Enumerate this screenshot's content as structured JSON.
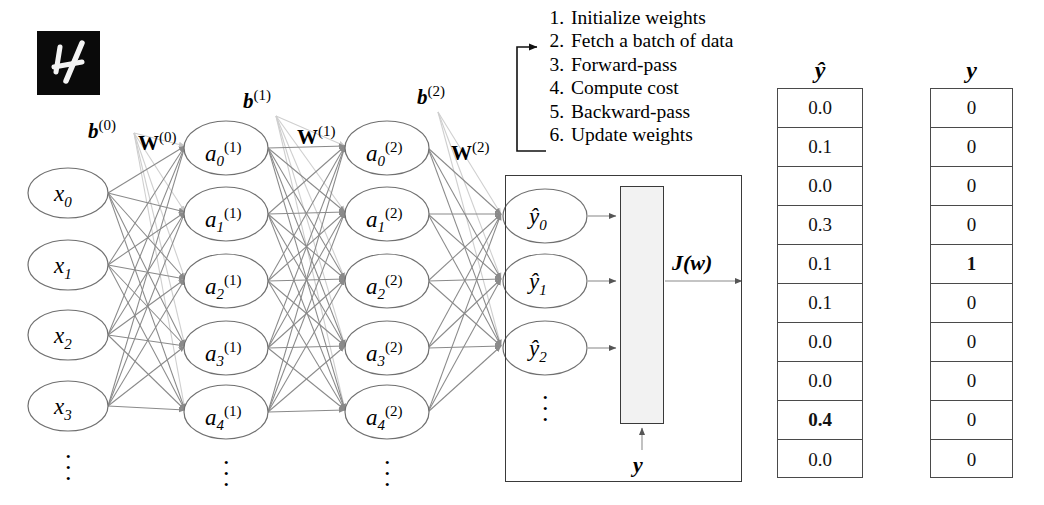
{
  "figure": {
    "type": "neural-network-architecture-diagram",
    "input_image": {
      "alt": "handwritten-digit-4",
      "digit": "4"
    }
  },
  "layers": {
    "input": {
      "name": "input-layer",
      "nodes": [
        {
          "base": "x",
          "sub": "0"
        },
        {
          "base": "x",
          "sub": "1"
        },
        {
          "base": "x",
          "sub": "2"
        },
        {
          "base": "x",
          "sub": "3"
        }
      ],
      "ellipsis": "⋮"
    },
    "hidden1": {
      "name": "hidden-layer-1",
      "superscript": "(1)",
      "nodes": [
        {
          "base": "a",
          "sub": "0",
          "sup": "(1)"
        },
        {
          "base": "a",
          "sub": "1",
          "sup": "(1)"
        },
        {
          "base": "a",
          "sub": "2",
          "sup": "(1)"
        },
        {
          "base": "a",
          "sub": "3",
          "sup": "(1)"
        },
        {
          "base": "a",
          "sub": "4",
          "sup": "(1)"
        }
      ],
      "ellipsis": "⋮"
    },
    "hidden2": {
      "name": "hidden-layer-2",
      "superscript": "(2)",
      "nodes": [
        {
          "base": "a",
          "sub": "0",
          "sup": "(2)"
        },
        {
          "base": "a",
          "sub": "1",
          "sup": "(2)"
        },
        {
          "base": "a",
          "sub": "2",
          "sup": "(2)"
        },
        {
          "base": "a",
          "sub": "3",
          "sup": "(2)"
        },
        {
          "base": "a",
          "sub": "4",
          "sup": "(2)"
        }
      ],
      "ellipsis": "⋮"
    },
    "output": {
      "name": "output-layer",
      "nodes": [
        {
          "base": "ŷ",
          "sub": "0"
        },
        {
          "base": "ŷ",
          "sub": "1"
        },
        {
          "base": "ŷ",
          "sub": "2"
        }
      ],
      "ellipsis": "⋮"
    }
  },
  "parameters": {
    "biases": [
      {
        "base": "b",
        "sup": "(0)"
      },
      {
        "base": "b",
        "sup": "(1)"
      },
      {
        "base": "b",
        "sup": "(2)"
      }
    ],
    "weights": [
      {
        "base": "W",
        "sup": "(0)"
      },
      {
        "base": "W",
        "sup": "(1)"
      },
      {
        "base": "W",
        "sup": "(2)"
      }
    ]
  },
  "training_steps": [
    {
      "num": "1.",
      "text": "Initialize weights"
    },
    {
      "num": "2.",
      "text": "Fetch a batch of data"
    },
    {
      "num": "3.",
      "text": "Forward-pass"
    },
    {
      "num": "4.",
      "text": "Compute cost"
    },
    {
      "num": "5.",
      "text": "Backward-pass"
    },
    {
      "num": "6.",
      "text": "Update weights"
    }
  ],
  "cost_block": {
    "name": "cost-function-block",
    "output_label": "J(w)",
    "target_input_label": "y"
  },
  "vectors": {
    "prediction": {
      "header": "ŷ",
      "values": [
        "0.0",
        "0.1",
        "0.0",
        "0.3",
        "0.1",
        "0.1",
        "0.0",
        "0.0",
        "0.4",
        "0.0"
      ],
      "bold_index": 8
    },
    "target": {
      "header": "y",
      "values": [
        "0",
        "0",
        "0",
        "0",
        "1",
        "0",
        "0",
        "0",
        "0",
        "0"
      ],
      "bold_index": 4
    }
  },
  "colors": {
    "edge": "#8a8a8a",
    "bias_edge": "#cfcfcf",
    "node_stroke": "#707070",
    "frame": "#3a3a3a",
    "bar_fill": "#f2f2f2",
    "text": "#000000"
  }
}
